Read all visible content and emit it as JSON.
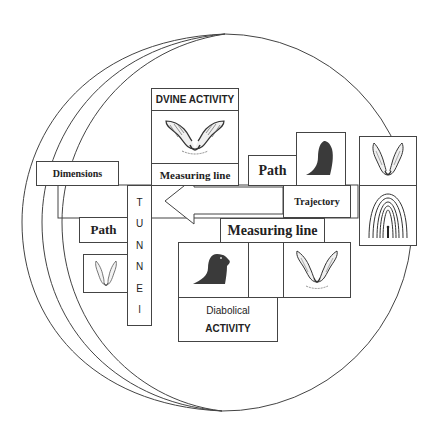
{
  "diagram": {
    "top_panel": {
      "title": "DVINE ACTIVITY",
      "icon": "angel-wings-icon",
      "footer": "Measuring line"
    },
    "dimensions_label": "Dimensions",
    "path_top_label": "Path",
    "path_top_icon": "dark-figure-icon",
    "right_column": {
      "top_icon": "angel-wings-icon",
      "bottom_icon": "tunnel-of-light-icon"
    },
    "trajectory_label": "Trajectory",
    "tunnel_letters": [
      "T",
      "U",
      "N",
      "N",
      "E",
      "l"
    ],
    "path_left_label": "Path",
    "path_left_icon": "angel-wings-icon",
    "arrow": {
      "direction": "left"
    },
    "measuring_line_lower": "Measuring line",
    "bottom_panel": {
      "left_icon": "dark-figure-icon",
      "right_icon": "angel-wings-icon",
      "title_line1": "Diabolical",
      "title_line2": "ACTIVITY"
    },
    "colors": {
      "line": "#444444",
      "dark_figure": "#3a3a3a",
      "background": "#ffffff"
    }
  }
}
